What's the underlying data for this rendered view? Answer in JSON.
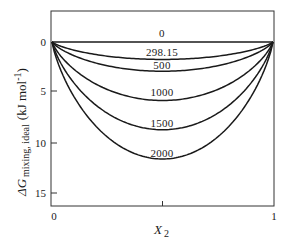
{
  "chart_data": {
    "type": "line",
    "title": "",
    "xlabel": "X_2",
    "xlabel_main": "X",
    "xlabel_sub": "2",
    "ylabel": "ΔG_mixing, ideal (kJ mol^-1)",
    "ylabel_main": "ΔG",
    "ylabel_sub": "mixing, ideal",
    "ylabel_unit": "(kJ  mol",
    "ylabel_unit_exp": "-1",
    "ylabel_unit_close": ")",
    "xlim": [
      0,
      1
    ],
    "ylim": [
      -2.9,
      16
    ],
    "y_inverted": true,
    "grid": false,
    "legend": "inline curve labels (temperature, K)",
    "x_ticks": [
      {
        "value": 0,
        "label": "0"
      },
      {
        "value": 0.5,
        "label": ""
      },
      {
        "value": 1,
        "label": "1"
      }
    ],
    "y_ticks": [
      {
        "value": 0,
        "label": "0"
      },
      {
        "value": 5,
        "label": "5"
      },
      {
        "value": 10,
        "label": "10"
      },
      {
        "value": 15,
        "label": "15"
      }
    ],
    "series": [
      {
        "name": "0",
        "temperature_K": 0,
        "min_at_x": 0.5,
        "min_value": 0.0
      },
      {
        "name": "298.15",
        "temperature_K": 298.15,
        "min_at_x": 0.5,
        "min_value": 1.72
      },
      {
        "name": "500",
        "temperature_K": 500,
        "min_at_x": 0.5,
        "min_value": 2.88
      },
      {
        "name": "1000",
        "temperature_K": 1000,
        "min_at_x": 0.5,
        "min_value": 5.76
      },
      {
        "name": "1500",
        "temperature_K": 1500,
        "min_at_x": 0.5,
        "min_value": 8.64
      },
      {
        "name": "2000",
        "temperature_K": 2000,
        "min_at_x": 0.5,
        "min_value": 11.53
      }
    ],
    "x": [
      0,
      0.05,
      0.1,
      0.2,
      0.3,
      0.4,
      0.5,
      0.6,
      0.7,
      0.8,
      0.9,
      0.95,
      1
    ],
    "curve_values": {
      "0": [
        0,
        0,
        0,
        0,
        0,
        0,
        0,
        0,
        0,
        0,
        0,
        0,
        0
      ],
      "298.15": [
        0,
        0.49,
        0.81,
        1.24,
        1.51,
        1.67,
        1.72,
        1.67,
        1.51,
        1.24,
        0.81,
        0.49,
        0
      ],
      "500": [
        0,
        0.82,
        1.35,
        2.08,
        2.54,
        2.8,
        2.88,
        2.8,
        2.54,
        2.08,
        1.35,
        0.82,
        0
      ],
      "1000": [
        0,
        1.65,
        2.7,
        4.16,
        5.08,
        5.59,
        5.76,
        5.59,
        5.08,
        4.16,
        2.7,
        1.65,
        0
      ],
      "1500": [
        0,
        2.47,
        4.05,
        6.24,
        7.62,
        8.39,
        8.64,
        8.39,
        7.62,
        6.24,
        4.05,
        2.47,
        0
      ],
      "2000": [
        0,
        3.3,
        5.41,
        8.32,
        10.16,
        11.19,
        11.53,
        11.19,
        10.16,
        8.32,
        5.41,
        3.3,
        0
      ]
    },
    "colors": {
      "line": "#1a1a1a",
      "frame": "#333333",
      "background": "#ffffff"
    }
  }
}
